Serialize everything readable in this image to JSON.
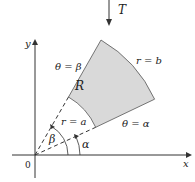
{
  "diagram": {
    "type": "polar-region",
    "transform_label": "T",
    "axes": {
      "x_label": "x",
      "y_label": "y",
      "origin_label": "0"
    },
    "region_label": "R",
    "boundaries": {
      "outer_arc": "r = b",
      "inner_arc": "r = a",
      "upper_ray": "θ = β",
      "lower_ray": "θ = α"
    },
    "angles": {
      "alpha": "α",
      "beta": "β"
    },
    "colors": {
      "region_fill": "#d9d9d9",
      "stroke": "#333333"
    }
  }
}
